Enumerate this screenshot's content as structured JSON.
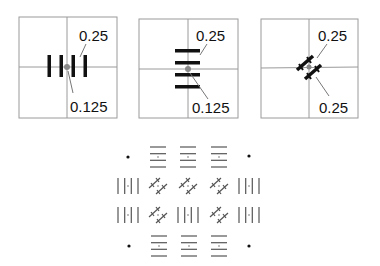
{
  "figure": {
    "panels": [
      {
        "id": "vertical",
        "orientation": "vertical",
        "bars": 4,
        "label_top": "0.25",
        "label_bottom": "0.125"
      },
      {
        "id": "horizontal",
        "orientation": "horizontal",
        "bars": 4,
        "label_top": "0.25",
        "label_bottom": "0.125"
      },
      {
        "id": "diagonal",
        "orientation": "diagonal",
        "bars": 2,
        "label_top": "0.25",
        "label_bottom": "0.25"
      }
    ],
    "grid": {
      "rows": [
        [
          "dot",
          "horizontal",
          "horizontal",
          "horizontal",
          "dot"
        ],
        [
          "vertical",
          "diagonal",
          "diagonal",
          "diagonal",
          "vertical"
        ],
        [
          "vertical",
          "diagonal",
          "vertical",
          "diagonal",
          "vertical"
        ],
        [
          "dot",
          "horizontal",
          "horizontal",
          "horizontal",
          "dot"
        ]
      ]
    },
    "colors": {
      "frame": "#9a9a9a",
      "bar": "#111111",
      "grid_glyph": "#555555",
      "center_dot": "#888888"
    }
  }
}
